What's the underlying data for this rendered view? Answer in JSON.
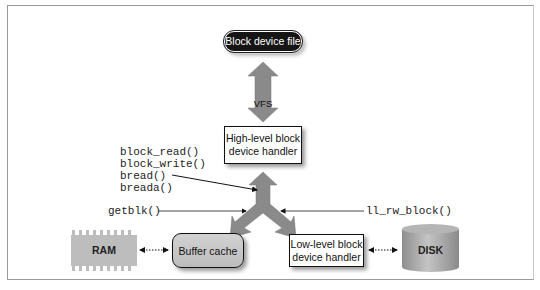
{
  "diagram": {
    "top_node": {
      "label": "Block device file",
      "shape": "rounded-pill",
      "fill": "#151515",
      "text_color": "#ffffff"
    },
    "vfs_arrow": {
      "label": "VFS",
      "direction": "bidirectional-vertical",
      "fill": "#8a8a8a"
    },
    "high_level_handler": {
      "line1": "High-level block",
      "line2": "device handler"
    },
    "functions_left": [
      "block_read()",
      "block_write()",
      "bread()",
      "breada()"
    ],
    "getblk_label": "getblk()",
    "ll_rw_block_label": "ll_rw_block()",
    "ram": {
      "label": "RAM",
      "fill": "#bdbdbd"
    },
    "buffer_cache": {
      "label": "Buffer cache",
      "fill": "#c6c6c6"
    },
    "low_level_handler": {
      "line1": "Low-level block",
      "line2": "device handler"
    },
    "disk": {
      "label": "DISK",
      "fill": "#a8a8a8"
    },
    "connectors": [
      {
        "from": "RAM",
        "to": "Buffer cache",
        "style": "dotted-bidirectional"
      },
      {
        "from": "Low-level block device handler",
        "to": "DISK",
        "style": "dotted-bidirectional"
      }
    ]
  }
}
